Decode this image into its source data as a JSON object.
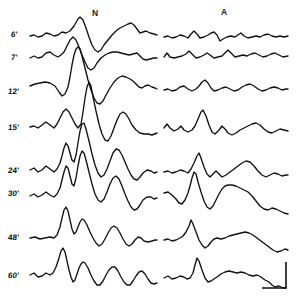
{
  "figure": {
    "background_color": "#ffffff",
    "trace_color": "#111111",
    "width": 300,
    "height": 304,
    "columns": [
      {
        "id": "N",
        "label": "N",
        "label_x": 95,
        "label_y": 14,
        "x_start": 30,
        "x_end": 157
      },
      {
        "id": "A",
        "label": "A",
        "label_x": 224,
        "label_y": 13,
        "x_start": 164,
        "x_end": 290
      }
    ],
    "row_labels": [
      {
        "label": "6'",
        "x": 11,
        "y": 31
      },
      {
        "label": "7'",
        "x": 11,
        "y": 54
      },
      {
        "label": "12'",
        "x": 8,
        "y": 88
      },
      {
        "label": "15'",
        "x": 8,
        "y": 124
      },
      {
        "label": "24'",
        "x": 8,
        "y": 167
      },
      {
        "label": "30'",
        "x": 8,
        "y": 190
      },
      {
        "label": "48'",
        "x": 8,
        "y": 234
      },
      {
        "label": "60'",
        "x": 8,
        "y": 272
      }
    ],
    "scale_bar": {
      "name": "calibration-marker",
      "vertical_x": 286,
      "vertical_y_top": 262,
      "vertical_y_bottom": 288,
      "horizontal_y": 288,
      "horizontal_x_left": 262,
      "horizontal_x_right": 286
    }
  },
  "chart_data": {
    "type": "line",
    "xlabel": "",
    "ylabel": "",
    "grid": false,
    "legend": "none",
    "categories": [
      "6'",
      "7'",
      "12'",
      "15'",
      "24'",
      "30'",
      "48'",
      "60'"
    ],
    "series": [
      {
        "name": "6'-N",
        "baseline_y": 36,
        "path": "M30,36 L34,35 L38,37 L42,36 L46,33 L50,34 L54,36 L58,35 L62,32 L66,33 L70,31 L74,26 L78,19 L80,17 L83,20 L86,28 L89,37 L92,45 L95,50 L98,52 L101,50 L104,45 L108,40 L112,35 L116,31 L120,28 L124,26 L128,24 L131,23 L134,25 L137,29 L140,33 L143,32 L146,31 L150,33 L154,34 L157,35"
      },
      {
        "name": "6'-A",
        "baseline_y": 36,
        "path": "M164,37 L168,36 L172,38 L176,37 L180,35 L184,36 L188,38 L191,34 L194,31 L197,34 L200,38 L204,37 L208,35 L211,33 L214,32 L217,35 L220,41 L223,39 L227,37 L231,36 L235,37 L238,35 L241,33 L244,36 L248,38 L252,37 L256,36 L260,37 L264,35 L268,34 L272,36 L276,37 L280,36 L284,37 L288,36"
      },
      {
        "name": "7'-N",
        "baseline_y": 56,
        "path": "M30,58 L34,56 L38,58 L42,57 L46,53 L50,52 L54,55 L58,57 L61,55 L64,52 L67,46 L70,40 L73,37 L76,40 L79,47 L82,55 L85,62 L88,68 L91,70 L94,68 L97,63 L101,58 L105,55 L109,53 L113,52 L117,52 L121,53 L125,54 L129,55 L133,54 L137,53 L140,56 L143,59 L146,60 L150,59 L154,58 L157,58"
      },
      {
        "name": "7'-A",
        "baseline_y": 56,
        "path": "M164,57 L167,53 L170,57 L174,58 L178,57 L182,56 L186,54 L189,51 L192,54 L196,58 L200,57 L204,55 L207,53 L210,55 L214,58 L218,57 L222,56 L225,53 L228,50 L231,53 L235,57 L239,56 L243,55 L247,56 L251,54 L255,53 L259,55 L263,57 L267,56 L271,54 L275,53 L279,55 L283,57 L288,56"
      },
      {
        "name": "12'-N",
        "baseline_y": 90,
        "path": "M30,86 L35,84 L40,83 L45,82 L50,83 L55,86 L59,92 L62,96 L65,94 L68,87 L70,77 L72,65 L74,55 L76,49 L78,47 L80,49 L82,56 L85,68 L88,80 L91,90 L94,98 L97,103 L100,104 L103,101 L106,95 L110,88 L114,82 L118,78 L122,76 L126,77 L130,79 L133,81 L136,84 L139,87 L142,88 L145,86 L148,85 L152,87 L155,88 L157,89"
      },
      {
        "name": "12'-A",
        "baseline_y": 90,
        "path": "M164,90 L168,89 L172,91 L176,90 L180,87 L184,86 L188,89 L192,91 L196,89 L199,86 L202,82 L205,80 L208,83 L211,88 L214,91 L218,90 L222,88 L226,87 L230,89 L234,91 L238,90 L242,87 L246,85 L250,84 L254,86 L258,89 L262,91 L266,90 L270,88 L274,87 L278,88 L282,90 L286,89 L288,89"
      },
      {
        "name": "15'-N",
        "baseline_y": 127,
        "path": "M30,127 L34,126 L38,128 L42,125 L46,122 L50,125 L54,128 L57,124 L60,118 L63,112 L66,109 L69,112 L72,118 L75,124 L78,128 L81,124 L83,112 L85,98 L87,87 L89,82 L91,86 L93,97 L96,111 L99,124 L102,134 L105,140 L108,141 L111,136 L114,128 L117,120 L120,114 L123,112 L126,114 L129,119 L132,125 L136,130 L140,133 L144,134 L148,134 L152,135 L157,133"
      },
      {
        "name": "15'-A",
        "baseline_y": 127,
        "path": "M164,128 L167,124 L170,128 L174,131 L178,129 L181,126 L184,130 L188,132 L192,130 L195,126 L198,119 L201,112 L203,110 L206,116 L209,125 L212,132 L215,134 L219,130 L222,126 L225,129 L228,133 L232,135 L236,133 L240,130 L244,128 L248,126 L252,124 L256,123 L260,125 L264,129 L268,132 L272,133 L276,131 L280,129 L284,130 L288,131"
      },
      {
        "name": "24'-N",
        "baseline_y": 170,
        "path": "M30,170 L34,168 L38,172 L42,170 L46,166 L50,169 L54,172 L57,169 L60,163 L62,156 L64,148 L66,143 L68,146 L70,153 L72,160 L74,162 L76,155 L78,143 L80,131 L82,124 L84,123 L86,129 L89,141 L92,154 L95,165 L98,173 L101,177 L104,175 L107,169 L110,161 L113,153 L116,149 L119,150 L122,155 L125,162 L128,169 L131,175 L134,179 L137,180 L140,177 L143,173 L147,170 L151,171 L154,173 L157,172"
      },
      {
        "name": "24'-A",
        "baseline_y": 170,
        "path": "M164,172 L168,171 L172,173 L176,172 L180,170 L184,171 L188,173 L191,169 L194,163 L197,156 L199,153 L201,158 L204,167 L207,174 L210,177 L213,174 L216,171 L219,174 L222,177 L226,175 L230,172 L234,169 L238,166 L242,163 L246,161 L250,162 L254,166 L258,171 L262,175 L266,177 L270,175 L274,173 L278,174 L282,176 L286,175 L288,175"
      },
      {
        "name": "30'-N",
        "baseline_y": 194,
        "path": "M30,196 L34,194 L38,197 L42,195 L46,192 L50,195 L54,197 L57,194 L60,188 L62,180 L64,172 L66,166 L68,168 L70,176 L72,184 L74,186 L76,178 L78,166 L80,156 L82,151 L84,153 L86,160 L89,172 L92,184 L95,194 L98,200 L101,202 L104,199 L107,192 L110,184 L113,178 L116,176 L119,179 L122,186 L125,194 L128,201 L131,207 L134,210 L137,209 L140,205 L143,200 L147,197 L151,197 L154,199 L157,198"
      },
      {
        "name": "30'-A",
        "baseline_y": 194,
        "path": "M164,193 L168,192 L172,195 L176,199 L179,203 L182,204 L185,200 L188,193 L190,186 L192,178 L194,172 L196,174 L198,182 L201,192 L204,201 L207,207 L210,209 L213,206 L216,200 L219,194 L222,189 L225,186 L228,185 L232,185 L236,186 L240,188 L244,190 L248,192 L252,196 L256,201 L260,206 L264,209 L268,210 L272,208 L276,209 L280,211 L284,213 L288,214"
      },
      {
        "name": "48'-N",
        "baseline_y": 237,
        "path": "M30,238 L35,237 L40,239 L45,238 L50,237 L54,238 L57,235 L60,227 L62,218 L64,210 L66,207 L68,211 L70,220 L72,229 L74,234 L76,232 L78,227 L80,222 L82,219 L84,220 L87,225 L90,232 L93,238 L96,243 L99,246 L102,244 L105,239 L108,233 L111,228 L114,226 L117,228 L120,233 L123,239 L126,244 L129,246 L132,244 L135,240 L138,237 L141,238 L144,241 L148,242 L152,241 L155,240 L157,240"
      },
      {
        "name": "48'-A",
        "baseline_y": 237,
        "path": "M164,240 L168,239 L172,241 L176,240 L180,238 L183,236 L186,232 L189,226 L191,220 L193,224 L196,232 L199,240 L202,245 L205,248 L208,246 L211,242 L214,239 L217,238 L221,239 L225,238 L229,236 L233,235 L237,234 L241,233 L245,232 L249,233 L253,235 L257,238 L261,241 L265,244 L269,247 L273,250 L277,252 L281,251 L285,249 L288,250"
      },
      {
        "name": "60'-N",
        "baseline_y": 272,
        "path": "M30,275 L34,273 L38,277 L42,276 L46,273 L50,275 L53,273 L56,267 L59,258 L61,251 L63,248 L65,252 L67,261 L69,270 L71,277 L73,282 L75,280 L77,274 L79,268 L81,264 L83,262 L85,263 L88,268 L91,275 L94,281 L97,285 L100,285 L103,281 L106,275 L109,270 L112,267 L115,267 L118,271 L121,277 L124,282 L127,285 L130,285 L133,281 L136,276 L139,272 L142,271 L145,274 L148,279 L151,283 L154,284 L157,283"
      },
      {
        "name": "60'-A",
        "baseline_y": 272,
        "path": "M164,278 L168,276 L172,279 L176,278 L180,276 L184,277 L187,279 L190,278 L193,273 L195,265 L197,258 L199,261 L202,270 L205,278 L208,282 L211,281 L214,279 L217,277 L221,274 L225,272 L229,271 L233,272 L237,273 L241,272 L245,273 L249,275 L253,276 L257,275 L261,277 L265,280 L269,282 L272,285 L275,287 L279,286 L283,288 L286,288"
      }
    ]
  }
}
